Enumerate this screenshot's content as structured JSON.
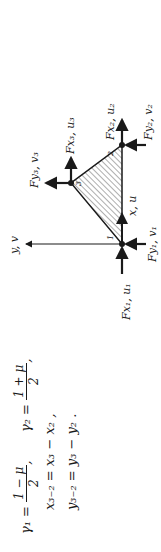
{
  "equations": {
    "gamma1_lhs": "γ₁ =",
    "gamma1_num": "1 − μ",
    "gamma1_den": "2",
    "gamma1_tail": ",",
    "gamma2_lhs": "γ₂ =",
    "gamma2_num": "1 + μ",
    "gamma2_den": "2",
    "gamma2_tail": ",",
    "x32": "x₃₋₂ = x₃ − x₂ ,",
    "y32": "y₃₋₂ = y₃ − y₂ ."
  },
  "diagram": {
    "axis_y_label": "y, v",
    "axis_x_label": "x, u",
    "node_labels": [
      "1",
      "2",
      "3"
    ],
    "forces": {
      "fx1": "Fx₁, u₁",
      "fy1": "Fy₁, v₁",
      "fx2": "Fx₂, u₂",
      "fy2": "Fy₂, v₂",
      "fx3": "Fx₃, u₃",
      "fy3": "Fy₃, v₃"
    }
  }
}
